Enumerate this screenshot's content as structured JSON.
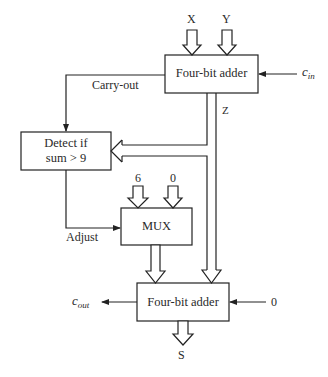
{
  "diagram": {
    "blocks": {
      "top_adder": {
        "label": "Four-bit adder"
      },
      "detect": {
        "line1": "Detect if",
        "line2": "sum > 9"
      },
      "mux": {
        "label": "MUX"
      },
      "bottom_adder": {
        "label": "Four-bit adder"
      }
    },
    "inputs": {
      "x": "X",
      "y": "Y",
      "cin_main": "c",
      "cin_sub": "in",
      "mux_in_a": "6",
      "mux_in_b": "0",
      "bottom_carry_in": "0"
    },
    "signals": {
      "carry_out": "Carry-out",
      "z": "Z",
      "adjust": "Adjust"
    },
    "outputs": {
      "cout_main": "c",
      "cout_sub": "out",
      "s": "S"
    }
  }
}
